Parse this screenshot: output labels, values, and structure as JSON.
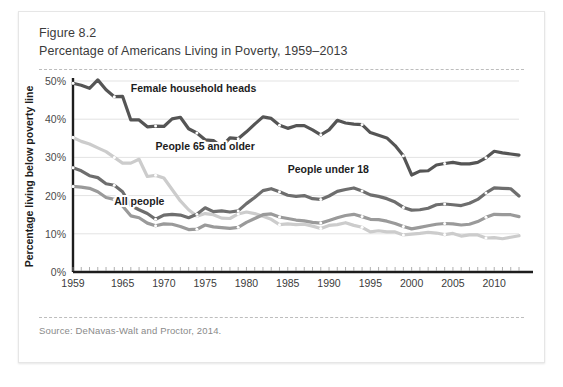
{
  "figure": {
    "number": "Figure 8.2",
    "title": "Percentage of Americans Living in Poverty, 1959–2013",
    "source": "Source: DeNavas-Walt and Proctor, 2014."
  },
  "chart_data": {
    "type": "line",
    "title": "Percentage of Americans Living in Poverty, 1959–2013",
    "xlabel": "",
    "ylabel": "Percentage living below poverty line",
    "xlim": [
      1959,
      2013
    ],
    "ylim": [
      0,
      50
    ],
    "grid": true,
    "legend": "inline-labels",
    "ytick_labels": [
      "0%",
      "10%",
      "20%",
      "30%",
      "40%",
      "50%"
    ],
    "ytick_values": [
      0,
      10,
      20,
      30,
      40,
      50
    ],
    "xtick_labels": [
      "1959",
      "1965",
      "1970",
      "1975",
      "1980",
      "1985",
      "1990",
      "1995",
      "2000",
      "2005",
      "2010"
    ],
    "xtick_values": [
      1959,
      1965,
      1970,
      1975,
      1980,
      1985,
      1990,
      1995,
      2000,
      2005,
      2010
    ],
    "x": [
      1959,
      1960,
      1961,
      1962,
      1963,
      1964,
      1965,
      1966,
      1967,
      1968,
      1969,
      1970,
      1971,
      1972,
      1973,
      1974,
      1975,
      1976,
      1977,
      1978,
      1979,
      1980,
      1981,
      1982,
      1983,
      1984,
      1985,
      1986,
      1987,
      1988,
      1989,
      1990,
      1991,
      1992,
      1993,
      1994,
      1995,
      1996,
      1997,
      1998,
      1999,
      2000,
      2001,
      2002,
      2003,
      2004,
      2005,
      2006,
      2007,
      2008,
      2009,
      2010,
      2011,
      2012,
      2013
    ],
    "series": [
      {
        "name": "Female household heads",
        "color": "#555555",
        "label_x": 1966,
        "label_y": 47,
        "values": [
          49.4,
          48.9,
          48.1,
          50.3,
          47.7,
          45.9,
          46.0,
          39.8,
          39.8,
          38.0,
          38.2,
          38.1,
          40.1,
          40.5,
          37.5,
          36.4,
          34.6,
          34.4,
          32.8,
          35.1,
          34.9,
          36.7,
          38.7,
          40.6,
          40.2,
          38.4,
          37.6,
          38.3,
          38.3,
          37.2,
          35.9,
          37.2,
          39.7,
          39.0,
          38.7,
          38.6,
          36.5,
          35.8,
          35.1,
          33.1,
          30.4,
          25.4,
          26.4,
          26.5,
          28.0,
          28.4,
          28.7,
          28.3,
          28.3,
          28.7,
          29.9,
          31.6,
          31.2,
          30.9,
          30.6
        ]
      },
      {
        "name": "People under 18",
        "color": "#6e6e6e",
        "label_x": 1985,
        "label_y": 26,
        "values": [
          27.3,
          26.5,
          25.2,
          24.7,
          23.1,
          22.7,
          21.0,
          17.4,
          16.3,
          15.3,
          13.8,
          14.9,
          15.1,
          14.9,
          14.2,
          15.1,
          16.8,
          15.8,
          16.0,
          15.7,
          16.0,
          17.9,
          19.5,
          21.3,
          21.8,
          21.0,
          20.1,
          19.8,
          20.0,
          19.2,
          19.0,
          19.9,
          21.1,
          21.6,
          22.0,
          21.2,
          20.2,
          19.8,
          19.2,
          18.3,
          16.9,
          16.2,
          16.3,
          16.7,
          17.6,
          17.8,
          17.6,
          17.4,
          18.0,
          19.0,
          20.7,
          22.0,
          21.9,
          21.8,
          19.9
        ]
      },
      {
        "name": "All people",
        "color": "#9a9a9a",
        "label_x": 1964,
        "label_y": 17.5,
        "values": [
          22.4,
          22.2,
          21.9,
          21.0,
          19.5,
          19.0,
          17.3,
          14.7,
          14.2,
          12.8,
          12.1,
          12.6,
          12.5,
          11.9,
          11.1,
          11.2,
          12.3,
          11.8,
          11.6,
          11.4,
          11.7,
          13.0,
          14.0,
          15.0,
          15.2,
          14.4,
          14.0,
          13.6,
          13.4,
          13.0,
          12.8,
          13.5,
          14.2,
          14.8,
          15.1,
          14.5,
          13.8,
          13.7,
          13.3,
          12.7,
          11.9,
          11.3,
          11.7,
          12.1,
          12.5,
          12.7,
          12.6,
          12.3,
          12.5,
          13.2,
          14.3,
          15.1,
          15.0,
          15.0,
          14.5
        ]
      },
      {
        "name": "People 65 and older",
        "color": "#cccccc",
        "label_x": 1969,
        "label_y": 32,
        "values": [
          35.2,
          34.2,
          33.5,
          32.5,
          31.5,
          30.0,
          28.5,
          28.5,
          29.5,
          25.0,
          25.3,
          24.6,
          21.6,
          18.6,
          16.3,
          14.6,
          15.3,
          15.0,
          14.1,
          14.0,
          15.2,
          15.7,
          15.3,
          14.6,
          13.8,
          12.4,
          12.6,
          12.4,
          12.5,
          12.0,
          11.4,
          12.2,
          12.4,
          12.9,
          12.2,
          11.7,
          10.5,
          10.8,
          10.5,
          10.5,
          9.7,
          9.9,
          10.1,
          10.4,
          10.2,
          9.8,
          10.1,
          9.4,
          9.7,
          9.7,
          8.9,
          9.0,
          8.7,
          9.1,
          9.5
        ]
      }
    ]
  }
}
